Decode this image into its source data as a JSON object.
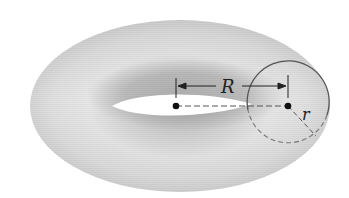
{
  "figure": {
    "labels": {
      "major_radius": "R",
      "minor_radius": "r"
    },
    "colors": {
      "background": "#ffffff",
      "torus_light": "#ededed",
      "torus_mid": "#d6d6d6",
      "torus_dark": "#b4b4b4",
      "hole": "#ffffff",
      "ink": "#222222",
      "circle": "#555555",
      "dash": "#777777"
    },
    "annotations": [
      {
        "id": "center-point",
        "description": "center of torus"
      },
      {
        "id": "tube-center-point",
        "description": "center of tube cross-section"
      },
      {
        "id": "R-dimension",
        "description": "distance from torus center to tube center"
      },
      {
        "id": "r-radius",
        "description": "radius of tube cross-section"
      }
    ]
  }
}
